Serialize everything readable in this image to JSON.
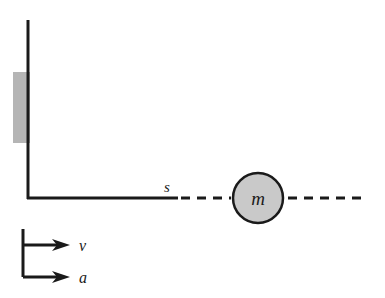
{
  "figure": {
    "type": "physics-schematic",
    "background_color": "#ffffff",
    "stroke_color": "#1a1a1a"
  },
  "wall": {
    "label": "wall",
    "line": {
      "x": 28,
      "y_top": 20,
      "y_bottom": 198,
      "thickness": 3
    },
    "support_block": {
      "label": "support-block",
      "x": 13,
      "y": 72,
      "width": 17,
      "height": 71,
      "fill_color": "#b5b5b5"
    }
  },
  "surface": {
    "label": "ground-line",
    "y": 198,
    "solid_from_x": 28,
    "solid_to_x": 178,
    "thickness": 3
  },
  "displacement": {
    "symbol": "s",
    "label_x": 167,
    "label_y": 192,
    "dashed_left": {
      "from_x": 181,
      "to_x": 231
    },
    "dashed_right": {
      "from_x": 288,
      "to_x": 363
    },
    "dash_pattern": "9 7",
    "thickness": 3
  },
  "mass": {
    "symbol": "m",
    "shape": "circle",
    "center_x": 258,
    "center_y": 198,
    "radius": 25,
    "fill_color": "#c9c9c9",
    "stroke_color": "#1a1a1a",
    "stroke_width": 2.5
  },
  "legend": {
    "label": "direction-legend",
    "bracket": {
      "x": 23,
      "y_top": 229,
      "y_bottom": 277,
      "thickness": 3
    },
    "arrows": [
      {
        "symbol": "v",
        "name": "velocity",
        "y": 245,
        "from_x": 23,
        "to_x": 68,
        "label_x": 79,
        "label_y": 251
      },
      {
        "symbol": "a",
        "name": "acceleration",
        "y": 277,
        "from_x": 23,
        "to_x": 68,
        "label_x": 79,
        "label_y": 283
      }
    ]
  }
}
